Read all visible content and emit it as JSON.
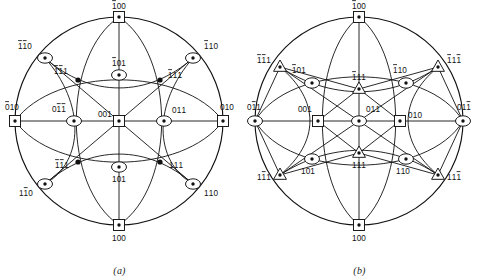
{
  "figure": {
    "type": "stereographic-projection-pair",
    "panels": [
      {
        "id": "a",
        "caption": "(a)",
        "description": "Stereographic projection of cubic crystal, [001] standard projection",
        "radius": 104,
        "center": {
          "x": 119,
          "y": 121
        },
        "poles": [
          {
            "label": "100",
            "overbars": [
              0
            ],
            "symbol": "square",
            "x": 119,
            "y": 17,
            "lx": 119,
            "ly": 9,
            "anchor": "middle"
          },
          {
            "label": "100",
            "overbars": [],
            "symbol": "square",
            "x": 119,
            "y": 225,
            "lx": 119,
            "ly": 241,
            "anchor": "middle"
          },
          {
            "label": "010",
            "overbars": [
              0
            ],
            "symbol": "square",
            "x": 15,
            "y": 121,
            "lx": 12,
            "ly": 110,
            "anchor": "middle"
          },
          {
            "label": "010",
            "overbars": [],
            "symbol": "square",
            "x": 223,
            "y": 121,
            "lx": 227,
            "ly": 110,
            "anchor": "middle"
          },
          {
            "label": "001",
            "overbars": [],
            "symbol": "square",
            "x": 119,
            "y": 121,
            "lx": 112,
            "ly": 117,
            "anchor": "end"
          },
          {
            "label": "110",
            "overbars": [
              0,
              1
            ],
            "symbol": "lens",
            "x": 45,
            "y": 58,
            "lx": 32,
            "ly": 49,
            "anchor": "end"
          },
          {
            "label": "110",
            "overbars": [
              0
            ],
            "symbol": "lens",
            "x": 193,
            "y": 58,
            "lx": 204,
            "ly": 49,
            "anchor": "start"
          },
          {
            "label": "110",
            "overbars": [
              1
            ],
            "symbol": "lens",
            "x": 45,
            "y": 184,
            "lx": 33,
            "ly": 196,
            "anchor": "end"
          },
          {
            "label": "110",
            "overbars": [],
            "symbol": "lens",
            "x": 193,
            "y": 184,
            "lx": 204,
            "ly": 196,
            "anchor": "start"
          },
          {
            "label": "101",
            "overbars": [
              0
            ],
            "symbol": "lens",
            "x": 119,
            "y": 75,
            "lx": 119,
            "ly": 66,
            "anchor": "middle"
          },
          {
            "label": "101",
            "overbars": [],
            "symbol": "lens",
            "x": 119,
            "y": 167,
            "lx": 119,
            "ly": 182,
            "anchor": "middle"
          },
          {
            "label": "011",
            "overbars": [
              1,
              2
            ],
            "symbol": "lens",
            "x": 74,
            "y": 121,
            "lx": 66,
            "ly": 112,
            "anchor": "end"
          },
          {
            "label": "011",
            "overbars": [],
            "symbol": "lens",
            "x": 164,
            "y": 121,
            "lx": 172,
            "ly": 113,
            "anchor": "start"
          },
          {
            "label": "111",
            "overbars": [
              0,
              1
            ],
            "symbol": "dot",
            "x": 78,
            "y": 80,
            "lx": 68,
            "ly": 74,
            "anchor": "end"
          },
          {
            "label": "111",
            "overbars": [
              0
            ],
            "symbol": "dot",
            "x": 160,
            "y": 80,
            "lx": 168,
            "ly": 78,
            "anchor": "start"
          },
          {
            "label": "111",
            "overbars": [
              0,
              1
            ],
            "symbol": "dot",
            "x": 78,
            "y": 162,
            "lx": 69,
            "ly": 168,
            "anchor": "end"
          },
          {
            "label": "111",
            "overbars": [],
            "symbol": "dot",
            "x": 160,
            "y": 162,
            "lx": 169,
            "ly": 168,
            "anchor": "start"
          }
        ]
      },
      {
        "id": "b",
        "caption": "(b)",
        "description": "Stereographic projection of cubic crystal, [011] standard projection",
        "radius": 104,
        "center": {
          "x": 119,
          "y": 121
        },
        "poles": [
          {
            "label": "100",
            "overbars": [
              0
            ],
            "symbol": "square",
            "x": 119,
            "y": 17,
            "lx": 119,
            "ly": 9,
            "anchor": "middle"
          },
          {
            "label": "100",
            "overbars": [],
            "symbol": "square",
            "x": 119,
            "y": 225,
            "lx": 119,
            "ly": 241,
            "anchor": "middle"
          },
          {
            "label": "001",
            "overbars": [],
            "symbol": "square",
            "x": 78,
            "y": 121,
            "lx": 72,
            "ly": 112,
            "anchor": "end"
          },
          {
            "label": "010",
            "overbars": [],
            "symbol": "square",
            "x": 160,
            "y": 121,
            "lx": 168,
            "ly": 118,
            "anchor": "start"
          },
          {
            "label": "011",
            "overbars": [
              1
            ],
            "symbol": "lens",
            "x": 15,
            "y": 121,
            "lx": 14,
            "ly": 110,
            "anchor": "middle"
          },
          {
            "label": "011",
            "overbars": [
              2
            ],
            "symbol": "lens",
            "x": 223,
            "y": 121,
            "lx": 224,
            "ly": 110,
            "anchor": "middle"
          },
          {
            "label": "011",
            "overbars": [],
            "symbol": "lens",
            "x": 119,
            "y": 121,
            "lx": 126,
            "ly": 112,
            "anchor": "start"
          },
          {
            "label": "111",
            "overbars": [
              0,
              1
            ],
            "symbol": "triangle",
            "x": 40,
            "y": 67,
            "lx": 31,
            "ly": 63,
            "anchor": "end"
          },
          {
            "label": "111",
            "overbars": [
              0,
              2
            ],
            "symbol": "triangle",
            "x": 198,
            "y": 67,
            "lx": 207,
            "ly": 63,
            "anchor": "start"
          },
          {
            "label": "111",
            "overbars": [
              1
            ],
            "symbol": "triangle",
            "x": 40,
            "y": 175,
            "lx": 31,
            "ly": 180,
            "anchor": "end"
          },
          {
            "label": "111",
            "overbars": [
              2
            ],
            "symbol": "triangle",
            "x": 198,
            "y": 175,
            "lx": 207,
            "ly": 180,
            "anchor": "start"
          },
          {
            "label": "111",
            "overbars": [
              0
            ],
            "symbol": "triangle",
            "x": 119,
            "y": 89,
            "lx": 119,
            "ly": 80,
            "anchor": "middle"
          },
          {
            "label": "111",
            "overbars": [],
            "symbol": "triangle",
            "x": 119,
            "y": 153,
            "lx": 119,
            "ly": 168,
            "anchor": "middle"
          },
          {
            "label": "101",
            "overbars": [
              0
            ],
            "symbol": "lens",
            "x": 72,
            "y": 83,
            "lx": 66,
            "ly": 73,
            "anchor": "end"
          },
          {
            "label": "101",
            "overbars": [],
            "symbol": "lens",
            "x": 72,
            "y": 159,
            "lx": 68,
            "ly": 174,
            "anchor": "middle"
          },
          {
            "label": "110",
            "overbars": [
              0
            ],
            "symbol": "lens",
            "x": 166,
            "y": 83,
            "lx": 160,
            "ly": 73,
            "anchor": "middle"
          },
          {
            "label": "110",
            "overbars": [],
            "symbol": "lens",
            "x": 166,
            "y": 159,
            "lx": 163,
            "ly": 174,
            "anchor": "middle"
          }
        ]
      }
    ]
  }
}
